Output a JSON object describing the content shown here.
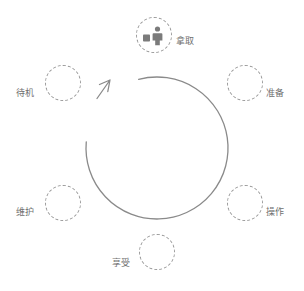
{
  "diagram": {
    "title": "",
    "type": "cycle-diagram",
    "direction": "counterclockwise",
    "colors": {
      "line": "#8a8a8a",
      "node_border": "#9a9a9a",
      "text": "#6f6f6f",
      "icon": "#7b7b7b",
      "background": "#ffffff"
    },
    "cycle": {
      "center_x": 157,
      "center_y": 148,
      "radius": 71,
      "gap_start_deg": 185,
      "gap_end_deg": 255
    },
    "nodes": [
      {
        "id": "pick",
        "label": "拿取",
        "icon": "person-with-box-icon",
        "angle_deg": 270,
        "cx": 154,
        "cy": 35,
        "label_x": 176,
        "label_y": 42,
        "has_icon": true
      },
      {
        "id": "prepare",
        "label": "准备",
        "icon": "",
        "angle_deg": 330,
        "cx": 245,
        "cy": 83,
        "label_x": 266,
        "label_y": 94,
        "has_icon": false
      },
      {
        "id": "operate",
        "label": "操作",
        "icon": "",
        "angle_deg": 30,
        "cx": 245,
        "cy": 203,
        "label_x": 266,
        "label_y": 213,
        "has_icon": false
      },
      {
        "id": "enjoy",
        "label": "享受",
        "icon": "",
        "angle_deg": 90,
        "cx": 157,
        "cy": 252,
        "label_x": 113,
        "label_y": 262,
        "has_icon": false
      },
      {
        "id": "maintain",
        "label": "维护",
        "icon": "",
        "angle_deg": 150,
        "cx": 63,
        "cy": 203,
        "label_x": 17,
        "label_y": 213,
        "has_icon": false
      },
      {
        "id": "standby",
        "label": "待机",
        "icon": "",
        "angle_deg": 210,
        "cx": 63,
        "cy": 83,
        "label_x": 17,
        "label_y": 94,
        "has_icon": false
      }
    ],
    "arrow": {
      "name": "counterclockwise-arrow-head",
      "tip_x": 110,
      "tip_y": 80
    }
  }
}
